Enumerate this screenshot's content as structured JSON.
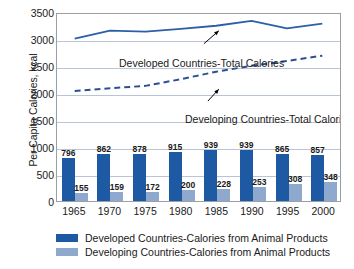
{
  "chart_data": {
    "type": "bar",
    "title": "",
    "xlabel": "",
    "ylabel": "Per Capita Calories, kcal",
    "ylim": [
      0,
      3500
    ],
    "ytick_values": [
      0,
      500,
      1000,
      1500,
      2000,
      2500,
      3000,
      3500
    ],
    "ytick_labels": [
      "0",
      "500",
      "1000",
      "1500",
      "2000",
      "2500",
      "3000",
      "3500"
    ],
    "grid": true,
    "categories": [
      "1965",
      "1970",
      "1975",
      "1980",
      "1985",
      "1990",
      "1995",
      "2000"
    ],
    "series": [
      {
        "name": "Developed Countries-Calories from Animal Products",
        "type": "bar",
        "color": "#1d5aa3",
        "values": [
          796,
          862,
          878,
          915,
          939,
          939,
          865,
          857
        ]
      },
      {
        "name": "Developing Countries-Calories from Animal Products",
        "type": "bar",
        "color": "#8ea8ce",
        "values": [
          155,
          159,
          172,
          200,
          228,
          253,
          308,
          348
        ]
      },
      {
        "name": "Developed Countries-Total Calories",
        "type": "line",
        "style": "solid",
        "color": "#2c5fa8",
        "values": [
          3040,
          3190,
          3170,
          3220,
          3280,
          3370,
          3230,
          3320
        ]
      },
      {
        "name": "Developing Countries-Total Calories",
        "type": "line",
        "style": "dashed",
        "color": "#2c4f92",
        "values": [
          2060,
          2110,
          2155,
          2280,
          2420,
          2530,
          2620,
          2720
        ]
      }
    ],
    "annotations": [
      {
        "text": "Developed Countries-Total Calories",
        "points_to_series": "Developed Countries-Total Calories"
      },
      {
        "text": "Developing Countries-Total Calories",
        "points_to_series": "Developing Countries-Total Calories"
      }
    ],
    "legend": {
      "position": "bottom",
      "entries": [
        {
          "label": "Developed Countries-Calories from Animal Products",
          "color": "#1d5aa3"
        },
        {
          "label": "Developing Countries-Calories from Animal Products",
          "color": "#8ea8ce"
        }
      ]
    }
  }
}
